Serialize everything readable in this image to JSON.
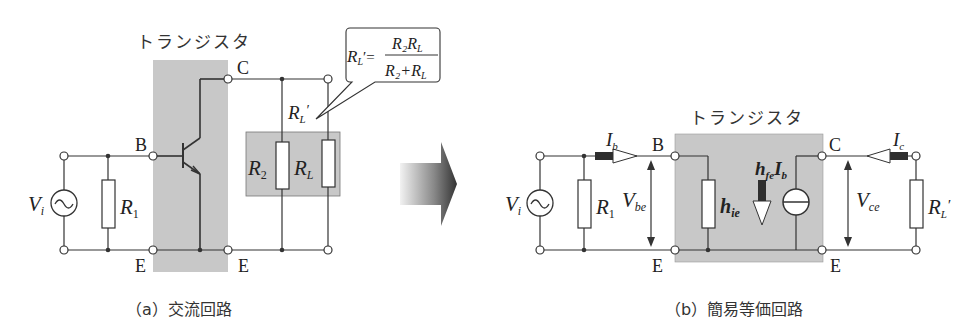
{
  "figure": {
    "a": {
      "caption": "（a）交流回路",
      "transistor_label": "トランジスタ",
      "terminals": {
        "B": "B",
        "C": "C",
        "E_left": "E",
        "E_right": "E"
      },
      "source": "V",
      "source_sub": "i",
      "r1": "R",
      "r1_sub": "1",
      "r2": "R",
      "r2_sub": "2",
      "rl": "R",
      "rl_sub": "L",
      "rl_prime": "R",
      "rl_prime_sub": "L",
      "prime": "′",
      "formula": {
        "lhs": "R",
        "lhs_sub": "L",
        "lhs_prime": "′=",
        "num": "R₂R",
        "num_sub": "L",
        "den": "R₂+R",
        "den_sub": "L"
      }
    },
    "b": {
      "caption": "（b）簡易等価回路",
      "transistor_label": "トランジスタ",
      "terminals": {
        "B": "B",
        "C": "C",
        "E_left": "E",
        "E_right": "E"
      },
      "source": "V",
      "source_sub": "i",
      "r1": "R",
      "r1_sub": "1",
      "ib": "I",
      "ib_sub": "b",
      "ic": "I",
      "ic_sub": "c",
      "vbe": "V",
      "vbe_sub": "be",
      "vce": "V",
      "vce_sub": "ce",
      "hie": "h",
      "hie_sub": "ie",
      "hfe": "h",
      "hfe_sub": "fe",
      "hfe_ib": "I",
      "hfe_ib_sub": "b",
      "rl_prime": "R",
      "rl_prime_sub": "L",
      "prime": "′"
    },
    "colors": {
      "box_fill": "#c8c8c8",
      "line": "#333333",
      "arrow_dark": "#3a3a3a"
    }
  }
}
